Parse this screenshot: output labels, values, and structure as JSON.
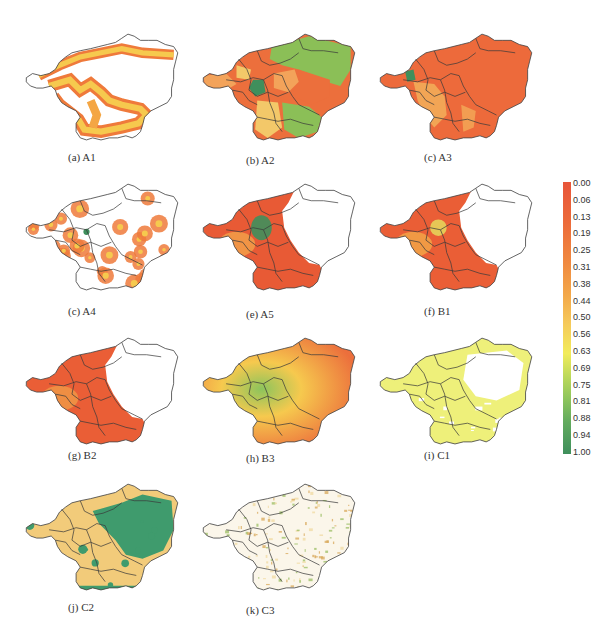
{
  "figure": {
    "top_fragment_text": [
      "··· ·· ··· ·",
      "··· ·· · ·"
    ],
    "panels": [
      {
        "id": "a",
        "caption": "(a) A1",
        "row": 0,
        "col": 0,
        "style": "edge-band",
        "colors": [
          "#f6c94e",
          "#ef7a3b",
          "#f4a644"
        ]
      },
      {
        "id": "b",
        "caption": "(b) A2",
        "row": 0,
        "col": 1,
        "style": "zones",
        "colors": [
          "#ec6f3c",
          "#f3a35a",
          "#8bbf57",
          "#f3c869",
          "#3f8f5c"
        ]
      },
      {
        "id": "c",
        "caption": "(c) A3",
        "row": 0,
        "col": 2,
        "style": "mostly-red",
        "colors": [
          "#ed6a3b",
          "#f3b45c",
          "#3f8f5c"
        ]
      },
      {
        "id": "d",
        "caption": "(c) A4",
        "row": 1,
        "col": 0,
        "style": "spots",
        "colors": [
          "#ef7a3b",
          "#f6c94e",
          "#3f8f5c"
        ]
      },
      {
        "id": "e",
        "caption": "(e) A5",
        "row": 1,
        "col": 1,
        "style": "west-red",
        "colors": [
          "#e85a35",
          "#f2a24a",
          "#3f8f5c"
        ]
      },
      {
        "id": "f",
        "caption": "(f) B1",
        "row": 1,
        "col": 2,
        "style": "west-red",
        "colors": [
          "#ea5e36",
          "#f3a748",
          "#e6d35a"
        ]
      },
      {
        "id": "g",
        "caption": "(g) B2",
        "row": 2,
        "col": 0,
        "style": "west-red",
        "colors": [
          "#ea5e36",
          "#f09a47"
        ]
      },
      {
        "id": "h",
        "caption": "(h) B3",
        "row": 2,
        "col": 1,
        "style": "gradient",
        "colors": [
          "#ec6f3c",
          "#f6c94e",
          "#8cc45c"
        ]
      },
      {
        "id": "i",
        "caption": "(i) C1",
        "row": 2,
        "col": 2,
        "style": "yellow",
        "colors": [
          "#eef07a",
          "#f4e86a"
        ]
      },
      {
        "id": "j",
        "caption": "(j) C2",
        "row": 3,
        "col": 0,
        "style": "green-tan",
        "colors": [
          "#f2cb7a",
          "#3f9b6d"
        ]
      },
      {
        "id": "k",
        "caption": "(k) C3",
        "row": 3,
        "col": 1,
        "style": "speckle",
        "colors": [
          "#f0d9a0",
          "#d8a85a",
          "#9bbd63"
        ]
      }
    ]
  },
  "legend": {
    "labels": [
      "0.00",
      "0.06",
      "0.13",
      "0.19",
      "0.25",
      "0.31",
      "0.38",
      "0.44",
      "0.50",
      "0.56",
      "0.63",
      "0.69",
      "0.75",
      "0.81",
      "0.88",
      "0.94",
      "1.00"
    ],
    "color_low": "#e8553a",
    "color_mid": "#f2ec5a",
    "color_high": "#3f8f5c"
  }
}
